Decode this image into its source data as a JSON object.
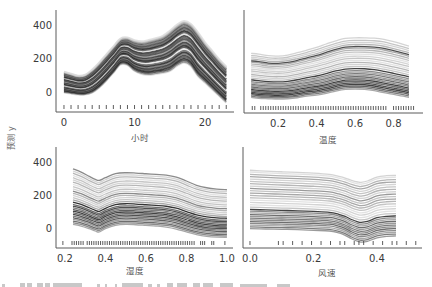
{
  "figure": {
    "ylabel": "预测 y",
    "layout": "2x2 ICE subplots, shared y axis",
    "grid": false
  },
  "chart_data": [
    {
      "type": "line",
      "subtype": "ice",
      "title": "",
      "xlabel": "小时",
      "ylabel": "预测 y",
      "xlim": [
        -1.13,
        24.1
      ],
      "ylim": [
        -119,
        490
      ],
      "xticks": [
        0,
        10,
        20
      ],
      "xtick_labels": [
        "0",
        "10",
        "20"
      ],
      "yticks": [
        0,
        200,
        400
      ],
      "ytick_labels": [
        "0",
        "200",
        "400"
      ],
      "show_yticklabels": true,
      "grid": false,
      "x": [
        0,
        1,
        2,
        3,
        4,
        5,
        6,
        7,
        8,
        9,
        10,
        11,
        12,
        13,
        14,
        15,
        16,
        17,
        18,
        19,
        20,
        21,
        22,
        23
      ],
      "series": [
        {
          "name": "ice_upper_envelope",
          "values": [
            119,
            107,
            95,
            101,
            131,
            173,
            221,
            269,
            316,
            322,
            305,
            298,
            305,
            316,
            330,
            360,
            395,
            418,
            400,
            350,
            291,
            241,
            191,
            147
          ]
        },
        {
          "name": "ice_lower_envelope",
          "values": [
            0,
            -6,
            -12,
            -12,
            0,
            30,
            72,
            119,
            168,
            165,
            131,
            113,
            107,
            113,
            119,
            131,
            161,
            181,
            161,
            101,
            62,
            22,
            -18,
            -58
          ]
        }
      ],
      "ice_line_fractions": [
        -0.03,
        0,
        0.04,
        0.08,
        0.12,
        0.16,
        0.2,
        0.24,
        0.28,
        0.33,
        0.37,
        0.41,
        0.45,
        0.49,
        0.53,
        0.57,
        0.61,
        0.65,
        0.7,
        0.74,
        0.78,
        0.82,
        0.86,
        0.9,
        0.94,
        0.97,
        1.0,
        1.03
      ],
      "ice_line_shades": [
        "#dddddd",
        "#888888",
        "#444444",
        "#222222",
        "#555555",
        "#333333",
        "#777777",
        "#222222",
        "#666666",
        "#e6e6e6",
        "#444444",
        "#222222",
        "#666666",
        "#333333",
        "#999999",
        "#444444",
        "#555555",
        "#333333",
        "#dddddd",
        "#555555",
        "#222222",
        "#666666",
        "#444444",
        "#777777",
        "#555555",
        "#999999",
        "#bbbbbb",
        "#dddddd"
      ],
      "rug_values": [
        0,
        1,
        2,
        3,
        4,
        5,
        6,
        7,
        8,
        9,
        10,
        11,
        12,
        13,
        14,
        15,
        16,
        17,
        18,
        19,
        20,
        21,
        22,
        23
      ],
      "rug_ranges": []
    },
    {
      "type": "line",
      "subtype": "ice",
      "title": "",
      "xlabel": "温度",
      "ylabel": "",
      "xlim": [
        0.023,
        0.953
      ],
      "ylim": [
        -125,
        490
      ],
      "xticks": [
        0.2,
        0.4,
        0.6,
        0.8
      ],
      "xtick_labels": [
        "0.2",
        "0.4",
        "0.6",
        "0.8"
      ],
      "yticks": [
        0,
        200,
        400
      ],
      "ytick_labels": [
        "0",
        "200",
        "400"
      ],
      "show_yticklabels": false,
      "grid": false,
      "x": [
        0.06,
        0.1,
        0.15,
        0.2,
        0.25,
        0.3,
        0.35,
        0.4,
        0.45,
        0.5,
        0.55,
        0.6,
        0.65,
        0.7,
        0.75,
        0.8,
        0.85,
        0.88
      ],
      "series": [
        {
          "name": "ice_upper_envelope",
          "values": [
            231,
            227,
            217,
            215,
            221,
            235,
            251,
            267,
            287,
            306,
            320,
            324,
            324,
            322,
            315,
            301,
            285,
            275
          ]
        },
        {
          "name": "ice_lower_envelope",
          "values": [
            -32,
            -38,
            -40,
            -42,
            -40,
            -34,
            -24,
            -18,
            -8,
            6,
            16,
            18,
            16,
            8,
            -4,
            -14,
            -24,
            -32
          ]
        }
      ],
      "ice_line_fractions": [
        0,
        0.03,
        0.06,
        0.09,
        0.12,
        0.15,
        0.18,
        0.21,
        0.24,
        0.27,
        0.3,
        0.33,
        0.36,
        0.4,
        0.44,
        0.48,
        0.52,
        0.56,
        0.6,
        0.64,
        0.68,
        0.72,
        0.76,
        0.8,
        0.83,
        0.87,
        0.91,
        0.95,
        1.0
      ],
      "ice_line_shades": [
        "#999999",
        "#666666",
        "#444444",
        "#222222",
        "#333333",
        "#555555",
        "#222222",
        "#777777",
        "#555555",
        "#888888",
        "#666666",
        "#999999",
        "#777777",
        "#222222",
        "#bbbbbb",
        "#cccccc",
        "#aaaaaa",
        "#dddddd",
        "#bbbbbb",
        "#cccccc",
        "#dddddd",
        "#bbbbbb",
        "#aaaaaa",
        "#999999",
        "#333333",
        "#aaaaaa",
        "#cccccc",
        "#bbbbbb",
        "#cccccc"
      ],
      "rug_values": [
        0.066,
        0.079
      ],
      "rug_ranges": [
        [
          0.11,
          0.77,
          0.013
        ],
        [
          0.8,
          0.91,
          0.013
        ]
      ]
    },
    {
      "type": "line",
      "subtype": "ice",
      "title": "",
      "xlabel": "湿度",
      "ylabel": "预测 y",
      "xlim": [
        0.156,
        1.03
      ],
      "ylim": [
        -121,
        491
      ],
      "xticks": [
        0.2,
        0.4,
        0.6,
        0.8,
        1.0
      ],
      "xtick_labels": [
        "0.2",
        "0.4",
        "0.6",
        "0.8",
        "1.0"
      ],
      "yticks": [
        0,
        200,
        400
      ],
      "ytick_labels": [
        "0",
        "200",
        "400"
      ],
      "show_yticklabels": true,
      "grid": false,
      "x": [
        0.24,
        0.28,
        0.32,
        0.35,
        0.37,
        0.4,
        0.45,
        0.5,
        0.55,
        0.6,
        0.65,
        0.7,
        0.75,
        0.8,
        0.85,
        0.9,
        0.95,
        1.0
      ],
      "series": [
        {
          "name": "ice_upper_envelope",
          "values": [
            359,
            339,
            313,
            295,
            289,
            305,
            329,
            335,
            333,
            329,
            325,
            321,
            309,
            285,
            259,
            244,
            236,
            232
          ]
        },
        {
          "name": "ice_lower_envelope",
          "values": [
            22,
            12,
            -4,
            -18,
            -24,
            -4,
            16,
            22,
            20,
            16,
            12,
            6,
            -6,
            -24,
            -40,
            -50,
            -55,
            -56
          ]
        }
      ],
      "ice_line_fractions": [
        0,
        0.03,
        0.06,
        0.09,
        0.12,
        0.15,
        0.18,
        0.21,
        0.24,
        0.27,
        0.3,
        0.33,
        0.36,
        0.4,
        0.44,
        0.48,
        0.52,
        0.56,
        0.6,
        0.64,
        0.68,
        0.72,
        0.76,
        0.8,
        0.84,
        0.88,
        0.92,
        0.96,
        1.0
      ],
      "ice_line_shades": [
        "#999999",
        "#777777",
        "#555555",
        "#888888",
        "#444444",
        "#666666",
        "#333333",
        "#555555",
        "#222222",
        "#444444",
        "#666666",
        "#333333",
        "#555555",
        "#111111",
        "#999999",
        "#bbbbbb",
        "#cccccc",
        "#aaaaaa",
        "#777777",
        "#cccccc",
        "#bbbbbb",
        "#dddddd",
        "#aaaaaa",
        "#cccccc",
        "#bbbbbb",
        "#dddddd",
        "#aaaaaa",
        "#cccccc",
        "#777777"
      ],
      "rug_values": [
        0.19,
        0.87,
        0.88,
        0.89,
        0.925,
        0.935,
        0.99
      ],
      "rug_ranges": [
        [
          0.235,
          0.29,
          0.011
        ],
        [
          0.31,
          0.84,
          0.011
        ]
      ]
    },
    {
      "type": "line",
      "subtype": "ice",
      "title": "",
      "xlabel": "风速",
      "ylabel": "",
      "xlim": [
        -0.022,
        0.542
      ],
      "ylim": [
        -121,
        491
      ],
      "xticks": [
        0.0,
        0.2,
        0.4
      ],
      "xtick_labels": [
        "0.0",
        "0.2",
        "0.4"
      ],
      "yticks": [
        0,
        200,
        400
      ],
      "ytick_labels": [
        "0",
        "200",
        "400"
      ],
      "show_yticklabels": false,
      "grid": false,
      "x": [
        0.0,
        0.05,
        0.1,
        0.15,
        0.2,
        0.25,
        0.28,
        0.3,
        0.32,
        0.34,
        0.35,
        0.37,
        0.4,
        0.43,
        0.46
      ],
      "series": [
        {
          "name": "ice_upper_envelope",
          "values": [
            350,
            345,
            341,
            337,
            333,
            325,
            313,
            303,
            289,
            279,
            277,
            285,
            309,
            317,
            319
          ]
        },
        {
          "name": "ice_lower_envelope",
          "values": [
            -4,
            -6,
            -8,
            -10,
            -14,
            -18,
            -30,
            -44,
            -65,
            -81,
            -85,
            -81,
            -59,
            -50,
            -48
          ]
        }
      ],
      "ice_line_fractions": [
        0,
        0.03,
        0.06,
        0.09,
        0.12,
        0.15,
        0.18,
        0.21,
        0.24,
        0.27,
        0.3,
        0.33,
        0.37,
        0.41,
        0.45,
        0.49,
        0.53,
        0.57,
        0.61,
        0.65,
        0.69,
        0.73,
        0.77,
        0.81,
        0.85,
        0.89,
        0.93,
        0.97,
        1.0
      ],
      "ice_line_shades": [
        "#888888",
        "#666666",
        "#999999",
        "#777777",
        "#555555",
        "#777777",
        "#666666",
        "#888888",
        "#555555",
        "#999999",
        "#777777",
        "#222222",
        "#bbbbbb",
        "#dddddd",
        "#cccccc",
        "#dddddd",
        "#bbbbbb",
        "#aaaaaa",
        "#999999",
        "#bbbbbb",
        "#888888",
        "#cccccc",
        "#aaaaaa",
        "#bbbbbb",
        "#cccccc",
        "#999999",
        "#aaaaaa",
        "#dddddd",
        "#cccccc"
      ],
      "rug_values": [
        0.0,
        0.0896,
        0.1045,
        0.1343,
        0.1642,
        0.194,
        0.2239,
        0.2537,
        0.2836,
        0.2985,
        0.3284,
        0.3433,
        0.3582,
        0.3881,
        0.4179,
        0.4478,
        0.4627,
        0.4925,
        0.5224
      ],
      "rug_ranges": []
    }
  ]
}
